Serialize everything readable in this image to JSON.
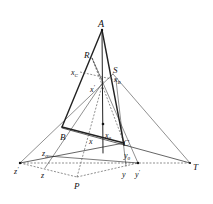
{
  "diagram": {
    "type": "projective-geometry-figure",
    "points": {
      "A": {
        "label": "A",
        "x": 102,
        "y": 30
      },
      "R": {
        "label": "R",
        "x": 92,
        "y": 58
      },
      "S": {
        "label": "S",
        "x": 113,
        "y": 74
      },
      "xC": {
        "label": "x",
        "sub": "C",
        "x": 80,
        "y": 72
      },
      "xB": {
        "label": "x",
        "sub": "B",
        "x": 112,
        "y": 80
      },
      "xp": {
        "label": "x",
        "sup": "'",
        "x": 103,
        "y": 82
      },
      "B": {
        "label": "B",
        "x": 62,
        "y": 127
      },
      "C": {
        "label": "C",
        "x": 123,
        "y": 143
      },
      "x0": {
        "label": "x",
        "sub": "0",
        "x": 103,
        "y": 147
      },
      "x": {
        "label": "x",
        "x": 91,
        "y": 141
      },
      "dot": {
        "x": 103,
        "y": 124
      },
      "z0": {
        "label": "z",
        "sub": "0",
        "x": 48,
        "y": 156
      },
      "zp": {
        "label": "z",
        "sup": "'",
        "x": 20,
        "y": 163
      },
      "z": {
        "label": "z",
        "x": 45,
        "y": 168
      },
      "P": {
        "label": "P",
        "x": 77,
        "y": 177
      },
      "y0": {
        "label": "y",
        "sub": "0",
        "x": 127,
        "y": 157
      },
      "y": {
        "label": "y",
        "x": 126,
        "y": 166
      },
      "yp": {
        "label": "y",
        "sup": "'",
        "x": 138,
        "y": 163
      },
      "T": {
        "label": "T",
        "x": 190,
        "y": 163
      }
    },
    "colors": {
      "line": "#222222",
      "dashed": "#444444",
      "background": "#ffffff"
    }
  },
  "labels": {
    "A": "A",
    "R": "R",
    "S": "S",
    "B": "B",
    "C": "C",
    "P": "P",
    "T": "T",
    "x": "x",
    "y": "y",
    "z": "z",
    "sub_C": "C",
    "sub_B": "B",
    "sub_0": "0",
    "prime": "'"
  }
}
